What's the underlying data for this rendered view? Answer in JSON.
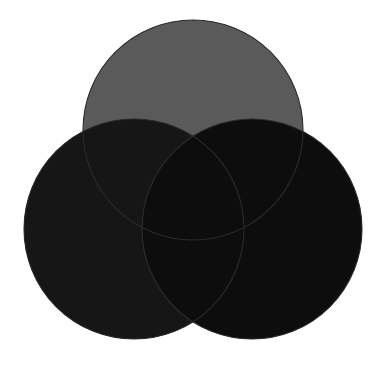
{
  "figure": {
    "name": "three-circle-venn-diagram",
    "type": "venn",
    "width": 384,
    "height": 369,
    "background_color": "#ffffff",
    "title": "",
    "caption": "",
    "labels_visible": false
  },
  "chart_data": {
    "type": "venn",
    "title": "",
    "subtitle": "",
    "xlabel": "",
    "ylabel": "",
    "grid": false,
    "legend_position": "none",
    "set_count": 3,
    "sets": [
      {
        "id": "top",
        "name": "top-circle",
        "label": "",
        "center_x": 193,
        "center_y": 130,
        "radius": 110,
        "fill": "#5a5a5a",
        "stroke": "#2b2b2b",
        "stroke_width": 1.1
      },
      {
        "id": "left",
        "name": "left-circle",
        "label": "",
        "center_x": 134,
        "center_y": 229,
        "radius": 110,
        "fill": "#1a1a1a",
        "stroke": "#2b2b2b",
        "stroke_width": 1.1
      },
      {
        "id": "right",
        "name": "right-circle",
        "label": "",
        "center_x": 252,
        "center_y": 229,
        "radius": 110,
        "fill": "#d8d8d8",
        "stroke": "#2b2b2b",
        "stroke_width": 1.1
      }
    ],
    "regions": [
      {
        "id": "top-only",
        "sets": [
          "top"
        ],
        "fill": "#5a5a5a",
        "value": ""
      },
      {
        "id": "left-only",
        "sets": [
          "left"
        ],
        "fill": "#1a1a1a",
        "value": ""
      },
      {
        "id": "right-only",
        "sets": [
          "right"
        ],
        "fill": "#d8d8d8",
        "value": ""
      },
      {
        "id": "top-left",
        "sets": [
          "top",
          "left"
        ],
        "fill": "#161616",
        "value": ""
      },
      {
        "id": "top-right",
        "sets": [
          "top",
          "right"
        ],
        "fill": "#7a7a7a",
        "value": ""
      },
      {
        "id": "left-right",
        "sets": [
          "left",
          "right"
        ],
        "fill": "#555555",
        "value": ""
      },
      {
        "id": "top-left-right",
        "sets": [
          "top",
          "left",
          "right"
        ],
        "fill": "#0d0d0d",
        "value": ""
      }
    ],
    "colors": {
      "top_only": "#5a5a5a",
      "left_only": "#1a1a1a",
      "right_only": "#d8d8d8",
      "top_left": "#161616",
      "top_right": "#7a7a7a",
      "left_right": "#555555",
      "center": "#0d0d0d",
      "outline": "#2b2b2b",
      "background": "#ffffff"
    }
  }
}
